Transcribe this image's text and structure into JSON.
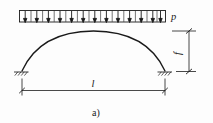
{
  "figure": {
    "caption": "a)",
    "labels": {
      "load": "p",
      "rise": "f",
      "span": "l"
    },
    "geometry": {
      "span_left_x": 22,
      "span_right_x": 165,
      "springing_y": 71,
      "crown_x": 93.5,
      "crown_y": 31,
      "load_box_left": 19,
      "load_box_right": 166,
      "load_box_top": 10,
      "load_box_bottom": 22,
      "arrow_count": 13,
      "rise_dim_x": 189,
      "rise_dim_top_y": 31,
      "rise_dim_bottom_y": 71,
      "span_dim_y": 90,
      "load_label_x": 172,
      "load_label_y": 19,
      "rise_label_x": 180,
      "rise_label_y": 54,
      "span_label_x": 93,
      "span_label_y": 86,
      "caption_x": 97,
      "caption_y": 114
    },
    "colors": {
      "line": "#1a1a1a",
      "thin_line": "#2b2b2b",
      "background": "#fdfdfd"
    }
  }
}
